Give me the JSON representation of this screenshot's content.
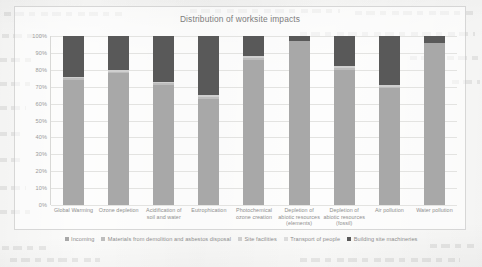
{
  "document": {
    "background_color": "#fbfbfa"
  },
  "chart_data": {
    "type": "bar",
    "subtype": "stacked-bar-100-percent",
    "title": "Distribution of worksite impacts",
    "xlabel": "",
    "ylabel": "",
    "ylim": [
      0,
      100
    ],
    "ytick_labels": [
      "100%",
      "90%",
      "80%",
      "70%",
      "60%",
      "50%",
      "40%",
      "30%",
      "20%",
      "10%",
      "0%"
    ],
    "ytick_values": [
      100,
      90,
      80,
      70,
      60,
      50,
      40,
      30,
      20,
      10,
      0
    ],
    "grid": true,
    "legend_position": "bottom",
    "categories": [
      "Global Warming",
      "Ozone depletion",
      "Acidification of soil and water",
      "Eutrophication",
      "Photochemical ozone creation",
      "Depletion of abiotic resources (elements)",
      "Depletion of abiotic resources (fossil)",
      "Air pollution",
      "Water pollution"
    ],
    "series": [
      {
        "name": "Incoming",
        "color": "#a8a8a8",
        "values": [
          74,
          78,
          71,
          63,
          86,
          97,
          80,
          69,
          96
        ]
      },
      {
        "name": "Materials from demolition and asbestos disposal",
        "color": "#bdbdbd",
        "values": [
          1,
          1,
          1,
          1,
          1,
          0,
          1,
          1,
          0
        ]
      },
      {
        "name": "Site facilities",
        "color": "#cfcfcf",
        "values": [
          1,
          1,
          1,
          1,
          1,
          0,
          1,
          1,
          0
        ]
      },
      {
        "name": "Transport of people",
        "color": "#dcdcdc",
        "values": [
          0,
          0,
          0,
          0,
          0,
          0,
          0,
          0,
          0
        ]
      },
      {
        "name": "Building site machineries",
        "color": "#595959",
        "values": [
          24,
          20,
          27,
          35,
          12,
          3,
          18,
          29,
          4
        ]
      }
    ]
  },
  "legend": {
    "items": [
      {
        "label": "Incoming",
        "color": "#a8a8a8"
      },
      {
        "label": "Materials from demolition and asbestos disposal",
        "color": "#bdbdbd"
      },
      {
        "label": "Site facilities",
        "color": "#cfcfcf"
      },
      {
        "label": "Transport of people",
        "color": "#dcdcdc"
      },
      {
        "label": "Building site machineries",
        "color": "#595959"
      }
    ]
  }
}
